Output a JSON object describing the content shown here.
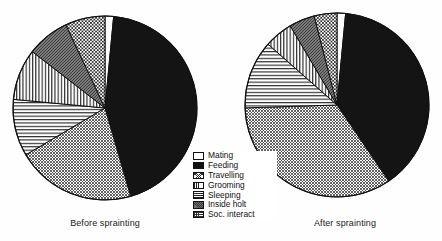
{
  "figure": {
    "background": "#fefefe",
    "stroke_color": "#111111"
  },
  "legend": {
    "title": "",
    "position": "center",
    "entries": [
      {
        "label": "Mating",
        "pattern": "solid-white",
        "swatch_class": "sw-mating"
      },
      {
        "label": "Feeding",
        "pattern": "solid-black",
        "swatch_class": "sw-feeding"
      },
      {
        "label": "Travelling",
        "pattern": "fine-crosshatch",
        "swatch_class": "sw-travelling"
      },
      {
        "label": "Grooming",
        "pattern": "vertical-lines",
        "swatch_class": "sw-grooming"
      },
      {
        "label": "Sleeping",
        "pattern": "horizontal-lines",
        "swatch_class": "sw-sleeping"
      },
      {
        "label": "Inside holt",
        "pattern": "dark-gray-hatch",
        "swatch_class": "sw-insideholt"
      },
      {
        "label": "Soc. interact",
        "pattern": "checker-dots",
        "swatch_class": "sw-socinteract"
      }
    ]
  },
  "charts": [
    {
      "caption": "Before sprainting",
      "center_x": 105,
      "center_y": 108,
      "radius": 92
    },
    {
      "caption": "After sprainting",
      "center_x": 337,
      "center_y": 105,
      "radius": 92
    }
  ],
  "chart_data": [
    {
      "type": "pie",
      "title": "Before sprainting",
      "xlabel": "",
      "ylabel": "",
      "start_angle_deg": 0,
      "direction": "clockwise",
      "units": "percent of time budget",
      "categories": [
        "Mating",
        "Feeding",
        "Travelling",
        "Sleeping",
        "Grooming",
        "Inside holt",
        "Soc. interact"
      ],
      "values": [
        1.5,
        44,
        21,
        10,
        9,
        7.5,
        7
      ],
      "legend": "center"
    },
    {
      "type": "pie",
      "title": "After sprainting",
      "xlabel": "",
      "ylabel": "",
      "start_angle_deg": 0,
      "direction": "clockwise",
      "units": "percent of time budget",
      "categories": [
        "Mating",
        "Feeding",
        "Travelling",
        "Sleeping",
        "Grooming",
        "Inside holt",
        "Soc. interact"
      ],
      "values": [
        1.5,
        39,
        34,
        12,
        5,
        4.5,
        4
      ],
      "legend": "center"
    }
  ]
}
